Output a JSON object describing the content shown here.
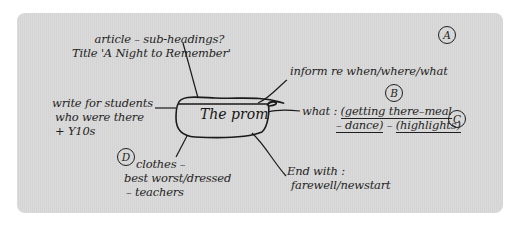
{
  "diagram": {
    "type": "mind-map",
    "center": {
      "label": "The prom"
    },
    "branches": [
      {
        "id": "article",
        "position": "top-left",
        "lines": [
          "article – sub-headings?",
          "Title 'A Night to Remember'"
        ]
      },
      {
        "id": "audience",
        "position": "left",
        "lines": [
          "write for students",
          "who were there",
          "+ Y10s"
        ]
      },
      {
        "id": "clothes",
        "position": "bottom-left",
        "badge": "D",
        "lines": [
          "clothes –",
          "best worst/dressed",
          "– teachers"
        ]
      },
      {
        "id": "inform",
        "position": "top-right",
        "badge": "A",
        "lines": [
          "inform re when/where/what"
        ]
      },
      {
        "id": "what",
        "position": "right",
        "badge_top": "B",
        "badge_right": "C",
        "prefix": "what : ",
        "items": [
          "(getting there–meal",
          "– dance)",
          "–",
          "(highlights)"
        ]
      },
      {
        "id": "end",
        "position": "bottom-right",
        "lines": [
          "End with :",
          "farewell/newstart"
        ]
      }
    ],
    "colors": {
      "panel_bg": "#d9d9d9",
      "ink": "#1f1f1f",
      "page_bg": "#ffffff"
    }
  }
}
